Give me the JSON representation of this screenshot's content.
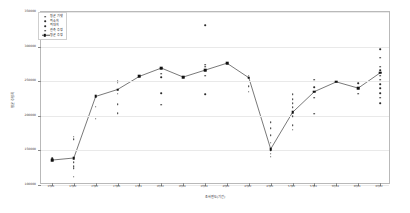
{
  "chart_data": {
    "type": "scatter",
    "title": "",
    "xlabel": "조사연도(기간)",
    "ylabel": "평균 추정치",
    "grid": true,
    "legend_position": "upper-left",
    "ylim": [
      100000,
      350000
    ],
    "yticks": [
      100000,
      150000,
      200000,
      250000,
      300000,
      350000
    ],
    "ytick_labels": [
      "100000",
      "150000",
      "200000",
      "250000",
      "300000",
      "350000"
    ],
    "categories": [
      "1차01",
      "1차02",
      "2차02",
      "2차06",
      "3차01",
      "3차02",
      "3차04",
      "3차04",
      "4차01",
      "4차02",
      "4차03",
      "5차02",
      "5차03",
      "5차04",
      "6차01",
      "6차02"
    ],
    "series": [
      {
        "name": "평균 기댓",
        "marker": "dot"
      },
      {
        "name": "최소치",
        "marker": "dot"
      },
      {
        "name": "최대치",
        "marker": "dot"
      },
      {
        "name": "관측 추정",
        "marker": "dot"
      },
      {
        "name": "평균 추정",
        "marker": "square-line"
      }
    ],
    "mean_line": {
      "name": "평균 추정",
      "values": [
        136000,
        139000,
        228000,
        238000,
        257000,
        269000,
        256000,
        266000,
        276000,
        255000,
        152000,
        205000,
        235000,
        249000,
        240000,
        262000
      ]
    },
    "scatter_points": [
      {
        "x": 0,
        "values": [
          136000,
          139000
        ]
      },
      {
        "x": 1,
        "values": [
          112000,
          124000,
          127000,
          133000,
          139000,
          166000,
          170000
        ]
      },
      {
        "x": 2,
        "values": [
          196000,
          213000,
          228000
        ]
      },
      {
        "x": 3,
        "values": [
          204000,
          217000,
          232000,
          238000,
          248000,
          251000
        ]
      },
      {
        "x": 4,
        "values": [
          257000
        ]
      },
      {
        "x": 5,
        "values": [
          216000,
          233000,
          256000,
          261000,
          269000
        ]
      },
      {
        "x": 6,
        "values": [
          256000
        ]
      },
      {
        "x": 7,
        "values": [
          231000,
          258000,
          266000,
          271000,
          274000,
          331000
        ]
      },
      {
        "x": 8,
        "values": [
          276000
        ]
      },
      {
        "x": 9,
        "values": [
          235000,
          243000,
          255000,
          258000
        ]
      },
      {
        "x": 10,
        "values": [
          141000,
          145000,
          150000,
          152000,
          161000,
          172000,
          182000,
          191000
        ]
      },
      {
        "x": 11,
        "values": [
          180000,
          186000,
          199000,
          205000,
          212000,
          218000,
          224000,
          231000
        ]
      },
      {
        "x": 12,
        "values": [
          203000,
          226000,
          235000,
          241000,
          252000
        ]
      },
      {
        "x": 13,
        "values": [
          249000
        ]
      },
      {
        "x": 14,
        "values": [
          232000,
          240000,
          247000
        ]
      },
      {
        "x": 15,
        "values": [
          218000,
          226000,
          233000,
          240000,
          246000,
          252000,
          258000,
          262000,
          266000,
          271000,
          284000,
          296000
        ]
      }
    ]
  }
}
